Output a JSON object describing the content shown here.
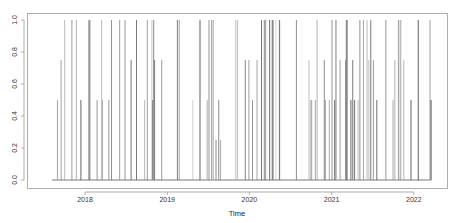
{
  "chart_data": {
    "type": "line",
    "title": "",
    "xlabel": "Time",
    "ylabel": "",
    "xlim": [
      2017.5,
      2022.4
    ],
    "ylim": [
      0,
      1
    ],
    "grid": false,
    "legend": null,
    "x_ticks": [
      {
        "value": 2018,
        "label": "2018"
      },
      {
        "value": 2019,
        "label": "2019"
      },
      {
        "value": 2020,
        "label": "2020"
      },
      {
        "value": 2021,
        "label": "2021"
      },
      {
        "value": 2022,
        "label": "2022"
      }
    ],
    "y_ticks": [
      {
        "value": 0.0,
        "label": "0.0"
      },
      {
        "value": 0.2,
        "label": "0.2"
      },
      {
        "value": 0.4,
        "label": "0.4"
      },
      {
        "value": 0.6,
        "label": "0.6"
      },
      {
        "value": 0.8,
        "label": "0.8"
      },
      {
        "value": 1.0,
        "label": "1.0"
      }
    ],
    "value_levels": [
      0,
      0.25,
      0.5,
      0.75,
      1.0
    ],
    "series": [
      {
        "name": "series",
        "color": "#555555",
        "description": "Dense intermittent time series of spikes between 0 and 1 at discrete levels (0.25, 0.5, 0.75, 1.0), baseline 0, from mid-2017 to early 2022",
        "segments": [
          {
            "start": 2017.6,
            "end": 2017.95,
            "density": 0.55,
            "dominant": [
              1.0,
              0.75,
              0.5
            ]
          },
          {
            "start": 2017.95,
            "end": 2018.3,
            "density": 0.45,
            "dominant": [
              1.0,
              0.5,
              0.75
            ]
          },
          {
            "start": 2018.3,
            "end": 2018.55,
            "density": 0.25,
            "dominant": [
              1.0,
              0.5
            ]
          },
          {
            "start": 2018.55,
            "end": 2018.95,
            "density": 0.6,
            "dominant": [
              1.0,
              0.75,
              0.5
            ]
          },
          {
            "start": 2018.95,
            "end": 2019.3,
            "density": 0.45,
            "dominant": [
              1.0,
              0.75,
              0.25
            ]
          },
          {
            "start": 2019.3,
            "end": 2019.55,
            "density": 0.5,
            "dominant": [
              1.0,
              0.75,
              0.5
            ]
          },
          {
            "start": 2019.55,
            "end": 2019.95,
            "density": 0.4,
            "dominant": [
              1.0,
              0.5,
              0.25
            ]
          },
          {
            "start": 2019.95,
            "end": 2020.4,
            "density": 0.6,
            "dominant": [
              1.0,
              0.75,
              0.5
            ]
          },
          {
            "start": 2020.4,
            "end": 2020.55,
            "density": 0.02,
            "dominant": [
              0.1
            ]
          },
          {
            "start": 2020.55,
            "end": 2020.95,
            "density": 0.55,
            "dominant": [
              1.0,
              0.75,
              0.5
            ]
          },
          {
            "start": 2020.95,
            "end": 2021.55,
            "density": 0.65,
            "dominant": [
              1.0,
              0.75,
              0.5
            ]
          },
          {
            "start": 2021.55,
            "end": 2022.0,
            "density": 0.55,
            "dominant": [
              1.0,
              0.75,
              0.5
            ]
          },
          {
            "start": 2022.0,
            "end": 2022.22,
            "density": 0.35,
            "dominant": [
              1.0,
              0.5
            ]
          }
        ],
        "last_point": {
          "x": 2022.21,
          "y": 0.5
        }
      }
    ]
  },
  "plot": {
    "x_axis_label": "Time",
    "line_color": "#555555",
    "frame_color": "#888888",
    "bg_color": "#ffffff"
  }
}
